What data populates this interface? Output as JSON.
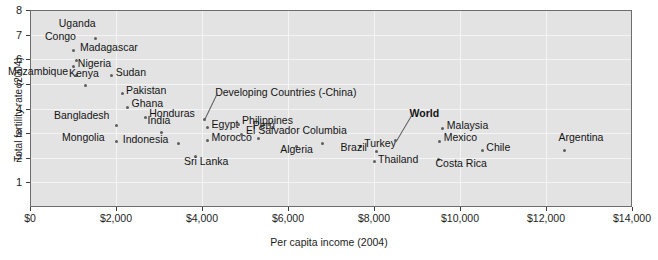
{
  "chart_data": {
    "type": "scatter",
    "title": "",
    "xlabel": "Per capita income (2004)",
    "ylabel": "Total fertility rate (2004)",
    "xlim": [
      0,
      14000
    ],
    "ylim": [
      0,
      8
    ],
    "grid": true,
    "legend": null,
    "xticks": [
      0,
      2000,
      4000,
      6000,
      8000,
      10000,
      12000,
      14000
    ],
    "xticklabels": [
      "$0",
      "$2,000",
      "$4,000",
      "$6,000",
      "$8,000",
      "$10,000",
      "$12,000",
      "$14,000"
    ],
    "yticks": [
      1,
      2,
      3,
      4,
      5,
      6,
      7,
      8
    ],
    "yticklabels": [
      "1",
      "2",
      "3",
      "4",
      "5",
      "6",
      "7",
      "8"
    ],
    "points": [
      {
        "name": "Uganda",
        "x": 1530,
        "y": 6.85,
        "lx": -37,
        "ly": -15,
        "bold": false
      },
      {
        "name": "Congo",
        "x": 1000,
        "y": 6.35,
        "lx": -28,
        "ly": -15,
        "bold": false
      },
      {
        "name": "Madagascar",
        "x": 1070,
        "y": 5.95,
        "lx": 4,
        "ly": -13,
        "bold": false
      },
      {
        "name": "Nigeria",
        "x": 1020,
        "y": 5.7,
        "lx": 4,
        "ly": -4,
        "bold": false
      },
      {
        "name": "Mozambique",
        "x": 1070,
        "y": 5.35,
        "lx": -68,
        "ly": -4,
        "bold": false
      },
      {
        "name": "Kenya",
        "x": 1280,
        "y": 4.94,
        "lx": -16,
        "ly": -12,
        "bold": false
      },
      {
        "name": "Sudan",
        "x": 1900,
        "y": 5.32,
        "lx": 4,
        "ly": -4,
        "bold": false
      },
      {
        "name": "Pakistan",
        "x": 2140,
        "y": 4.6,
        "lx": 4,
        "ly": -4,
        "bold": false
      },
      {
        "name": "Ghana",
        "x": 2270,
        "y": 4.05,
        "lx": 4,
        "ly": -4,
        "bold": false
      },
      {
        "name": "Honduras",
        "x": 2680,
        "y": 3.65,
        "lx": 4,
        "ly": -4,
        "bold": false
      },
      {
        "name": "Bangladesh",
        "x": 2000,
        "y": 3.3,
        "lx": -62,
        "ly": -11,
        "bold": false
      },
      {
        "name": "Mongolia",
        "x": 2000,
        "y": 2.66,
        "lx": -54,
        "ly": -4,
        "bold": false
      },
      {
        "name": "India",
        "x": 3060,
        "y": 3.04,
        "lx": -14,
        "ly": -12,
        "bold": false
      },
      {
        "name": "Indonesia",
        "x": 3460,
        "y": 2.59,
        "lx": -56,
        "ly": -4,
        "bold": false
      },
      {
        "name": "Sri Lanka",
        "x": 3860,
        "y": 2.05,
        "lx": -12,
        "ly": 4,
        "bold": false
      },
      {
        "name": "Developing Countries (-China)",
        "x": 4050,
        "y": 3.55,
        "lx": 11,
        "ly": -28,
        "bold": false,
        "leader": true
      },
      {
        "name": "Egypt",
        "x": 4130,
        "y": 3.24,
        "lx": 4,
        "ly": -3,
        "bold": false
      },
      {
        "name": "Morocco",
        "x": 4130,
        "y": 2.7,
        "lx": 4,
        "ly": -4,
        "bold": false
      },
      {
        "name": "Philippines",
        "x": 4840,
        "y": 3.36,
        "lx": 4,
        "ly": -4,
        "bold": false
      },
      {
        "name": "El Salvador",
        "x": 4930,
        "y": 2.96,
        "lx": 4,
        "ly": -4,
        "bold": false
      },
      {
        "name": "Perú",
        "x": 5320,
        "y": 2.79,
        "lx": -6,
        "ly": -13,
        "bold": false
      },
      {
        "name": "Algeria",
        "x": 6190,
        "y": 2.46,
        "lx": -16,
        "ly": 3,
        "bold": false
      },
      {
        "name": "Columbia",
        "x": 6800,
        "y": 2.59,
        "lx": -20,
        "ly": -13,
        "bold": false
      },
      {
        "name": "Turkey",
        "x": 7680,
        "y": 2.44,
        "lx": 4,
        "ly": -4,
        "bold": false
      },
      {
        "name": "Brazil",
        "x": 8060,
        "y": 2.26,
        "lx": -36,
        "ly": -4,
        "bold": false
      },
      {
        "name": "Thailand",
        "x": 8000,
        "y": 1.83,
        "lx": 4,
        "ly": -3,
        "bold": false
      },
      {
        "name": "World",
        "x": 8500,
        "y": 2.7,
        "lx": 14,
        "ly": -28,
        "bold": true,
        "leader": true
      },
      {
        "name": "Malaysia",
        "x": 9600,
        "y": 3.18,
        "lx": 4,
        "ly": -4,
        "bold": false
      },
      {
        "name": "Mexico",
        "x": 9530,
        "y": 2.68,
        "lx": 4,
        "ly": -4,
        "bold": false
      },
      {
        "name": "Chile",
        "x": 10520,
        "y": 2.29,
        "lx": 4,
        "ly": -4,
        "bold": false
      },
      {
        "name": "Costa Rica",
        "x": 9500,
        "y": 1.93,
        "lx": -3,
        "ly": 4,
        "bold": false
      },
      {
        "name": "Argentina",
        "x": 12430,
        "y": 2.3,
        "lx": -6,
        "ly": -13,
        "bold": false
      }
    ]
  },
  "colors": {
    "plot_background": "#e3e3e3",
    "grid": "#f4f4f4",
    "marker": "#5e5e5e",
    "text": "#141414",
    "axis": "#3a3a3a"
  }
}
